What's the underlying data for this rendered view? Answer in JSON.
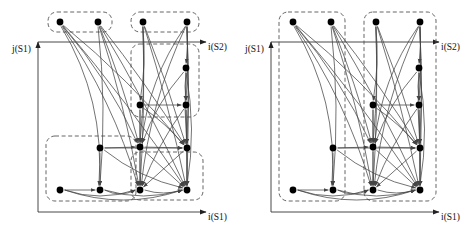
{
  "figure": {
    "title": "",
    "type": "diagram",
    "background": "#ffffff",
    "line_color": "#444444",
    "node_color": "#000000",
    "dashed_color": "#555555",
    "width": 465,
    "height": 237
  },
  "panels": [
    {
      "id": "left",
      "name": "left-diagram",
      "axes": {
        "y_label": "j(S1)",
        "x_bottom_label": "i(S1)",
        "x_top_label": "i(S2)"
      },
      "groups": [
        {
          "name": "top-left-group",
          "x": 48,
          "y": 12,
          "w": 64,
          "h": 20
        },
        {
          "name": "top-right-group",
          "x": 131,
          "y": 12,
          "w": 68,
          "h": 20
        },
        {
          "name": "mid-right-group",
          "x": 131,
          "y": 44,
          "w": 68,
          "h": 73
        },
        {
          "name": "bottom-left-group",
          "x": 46,
          "y": 136,
          "w": 90,
          "h": 65
        },
        {
          "name": "bottom-right-group",
          "x": 131,
          "y": 152,
          "w": 72,
          "h": 48
        }
      ],
      "nodes": [
        {
          "id": "n1",
          "x": 60,
          "y": 22
        },
        {
          "id": "n2",
          "x": 98,
          "y": 22
        },
        {
          "id": "n3",
          "x": 143,
          "y": 22
        },
        {
          "id": "n4",
          "x": 187,
          "y": 22
        },
        {
          "id": "n5",
          "x": 186,
          "y": 68
        },
        {
          "id": "n6",
          "x": 140,
          "y": 105
        },
        {
          "id": "n7",
          "x": 186,
          "y": 105
        },
        {
          "id": "n8",
          "x": 100,
          "y": 148
        },
        {
          "id": "n9",
          "x": 140,
          "y": 147
        },
        {
          "id": "n10",
          "x": 187,
          "y": 148
        },
        {
          "id": "n11",
          "x": 60,
          "y": 190
        },
        {
          "id": "n12",
          "x": 100,
          "y": 190
        },
        {
          "id": "n13",
          "x": 140,
          "y": 190
        },
        {
          "id": "n14",
          "x": 187,
          "y": 190
        }
      ],
      "edges": [
        {
          "from": "n1",
          "to": "n12",
          "curve": -26
        },
        {
          "from": "n1",
          "to": "n9",
          "curve": -10
        },
        {
          "from": "n1",
          "to": "n13",
          "curve": -14
        },
        {
          "from": "n1",
          "to": "n10",
          "curve": -8
        },
        {
          "from": "n1",
          "to": "n14",
          "curve": -6
        },
        {
          "from": "n2",
          "to": "n12",
          "curve": -8
        },
        {
          "from": "n2",
          "to": "n9",
          "curve": -4
        },
        {
          "from": "n2",
          "to": "n10",
          "curve": -4
        },
        {
          "from": "n2",
          "to": "n13",
          "curve": -6
        },
        {
          "from": "n2",
          "to": "n14",
          "curve": -5
        },
        {
          "from": "n3",
          "to": "n6",
          "curve": -5
        },
        {
          "from": "n3",
          "to": "n9",
          "curve": -4
        },
        {
          "from": "n3",
          "to": "n13",
          "curve": -4
        },
        {
          "from": "n3",
          "to": "n10",
          "curve": -3
        },
        {
          "from": "n3",
          "to": "n14",
          "curve": -4
        },
        {
          "from": "n4",
          "to": "n5",
          "curve": -2
        },
        {
          "from": "n4",
          "to": "n7",
          "curve": -3
        },
        {
          "from": "n4",
          "to": "n10",
          "curve": -3
        },
        {
          "from": "n4",
          "to": "n14",
          "curve": -3
        },
        {
          "from": "n4",
          "to": "n13",
          "curve": 14
        },
        {
          "from": "n5",
          "to": "n7",
          "curve": 2
        },
        {
          "from": "n5",
          "to": "n9",
          "curve": 8
        },
        {
          "from": "n5",
          "to": "n10",
          "curve": 3
        },
        {
          "from": "n6",
          "to": "n7",
          "curve": 0
        },
        {
          "from": "n6",
          "to": "n9",
          "curve": 0
        },
        {
          "from": "n6",
          "to": "n13",
          "curve": 0
        },
        {
          "from": "n7",
          "to": "n10",
          "curve": 0
        },
        {
          "from": "n7",
          "to": "n14",
          "curve": 0
        },
        {
          "from": "n7",
          "to": "n13",
          "curve": 6
        },
        {
          "from": "n8",
          "to": "n9",
          "curve": 0
        },
        {
          "from": "n8",
          "to": "n12",
          "curve": 0
        },
        {
          "from": "n8",
          "to": "n10",
          "curve": 0
        },
        {
          "from": "n9",
          "to": "n10",
          "curve": 0
        },
        {
          "from": "n9",
          "to": "n13",
          "curve": 0
        },
        {
          "from": "n9",
          "to": "n14",
          "curve": 0
        },
        {
          "from": "n10",
          "to": "n14",
          "curve": 0
        },
        {
          "from": "n10",
          "to": "n13",
          "curve": 0
        },
        {
          "from": "n11",
          "to": "n12",
          "curve": 0
        },
        {
          "from": "n11",
          "to": "n13",
          "curve": 12
        },
        {
          "from": "n11",
          "to": "n14",
          "curve": 20
        },
        {
          "from": "n12",
          "to": "n13",
          "curve": 8
        },
        {
          "from": "n12",
          "to": "n14",
          "curve": 12
        },
        {
          "from": "n13",
          "to": "n14",
          "curve": 6
        },
        {
          "from": "n6",
          "to": "n10",
          "curve": -4
        },
        {
          "from": "n8",
          "to": "n14",
          "curve": 10
        },
        {
          "from": "n5",
          "to": "n14",
          "curve": -10
        },
        {
          "from": "n4",
          "to": "n9",
          "curve": 16
        }
      ]
    },
    {
      "id": "right",
      "name": "right-diagram",
      "axes": {
        "y_label": "j(S1)",
        "x_bottom_label": "i(S1)",
        "x_top_label": "i(S2)"
      },
      "groups": [
        {
          "name": "left-column-group",
          "x": 46,
          "y": 12,
          "w": 66,
          "h": 189
        },
        {
          "name": "right-column-group",
          "x": 131,
          "y": 12,
          "w": 72,
          "h": 189
        }
      ],
      "nodes": [
        {
          "id": "n1",
          "x": 60,
          "y": 22
        },
        {
          "id": "n2",
          "x": 98,
          "y": 22
        },
        {
          "id": "n3",
          "x": 143,
          "y": 22
        },
        {
          "id": "n4",
          "x": 187,
          "y": 22
        },
        {
          "id": "n5",
          "x": 186,
          "y": 68
        },
        {
          "id": "n6",
          "x": 140,
          "y": 105
        },
        {
          "id": "n7",
          "x": 186,
          "y": 105
        },
        {
          "id": "n8",
          "x": 100,
          "y": 148
        },
        {
          "id": "n9",
          "x": 140,
          "y": 147
        },
        {
          "id": "n10",
          "x": 187,
          "y": 148
        },
        {
          "id": "n11",
          "x": 60,
          "y": 190
        },
        {
          "id": "n12",
          "x": 100,
          "y": 190
        },
        {
          "id": "n13",
          "x": 140,
          "y": 190
        },
        {
          "id": "n14",
          "x": 187,
          "y": 190
        }
      ],
      "edges": [
        {
          "from": "n1",
          "to": "n12",
          "curve": -26
        },
        {
          "from": "n1",
          "to": "n9",
          "curve": -10
        },
        {
          "from": "n1",
          "to": "n13",
          "curve": -14
        },
        {
          "from": "n1",
          "to": "n10",
          "curve": -8
        },
        {
          "from": "n1",
          "to": "n14",
          "curve": -6
        },
        {
          "from": "n2",
          "to": "n12",
          "curve": -8
        },
        {
          "from": "n2",
          "to": "n9",
          "curve": -4
        },
        {
          "from": "n2",
          "to": "n10",
          "curve": -4
        },
        {
          "from": "n2",
          "to": "n13",
          "curve": -6
        },
        {
          "from": "n2",
          "to": "n14",
          "curve": -5
        },
        {
          "from": "n3",
          "to": "n6",
          "curve": -5
        },
        {
          "from": "n3",
          "to": "n9",
          "curve": -4
        },
        {
          "from": "n3",
          "to": "n13",
          "curve": -4
        },
        {
          "from": "n3",
          "to": "n10",
          "curve": -3
        },
        {
          "from": "n3",
          "to": "n14",
          "curve": -4
        },
        {
          "from": "n4",
          "to": "n5",
          "curve": -2
        },
        {
          "from": "n4",
          "to": "n7",
          "curve": -3
        },
        {
          "from": "n4",
          "to": "n10",
          "curve": -3
        },
        {
          "from": "n4",
          "to": "n14",
          "curve": -3
        },
        {
          "from": "n4",
          "to": "n13",
          "curve": 14
        },
        {
          "from": "n5",
          "to": "n7",
          "curve": 2
        },
        {
          "from": "n5",
          "to": "n9",
          "curve": 8
        },
        {
          "from": "n5",
          "to": "n10",
          "curve": 3
        },
        {
          "from": "n6",
          "to": "n7",
          "curve": 0
        },
        {
          "from": "n6",
          "to": "n9",
          "curve": 0
        },
        {
          "from": "n6",
          "to": "n13",
          "curve": 0
        },
        {
          "from": "n7",
          "to": "n10",
          "curve": 0
        },
        {
          "from": "n7",
          "to": "n14",
          "curve": 0
        },
        {
          "from": "n7",
          "to": "n13",
          "curve": 6
        },
        {
          "from": "n8",
          "to": "n9",
          "curve": 0
        },
        {
          "from": "n8",
          "to": "n12",
          "curve": 0
        },
        {
          "from": "n8",
          "to": "n10",
          "curve": 0
        },
        {
          "from": "n9",
          "to": "n10",
          "curve": 0
        },
        {
          "from": "n9",
          "to": "n13",
          "curve": 0
        },
        {
          "from": "n9",
          "to": "n14",
          "curve": 0
        },
        {
          "from": "n10",
          "to": "n14",
          "curve": 0
        },
        {
          "from": "n10",
          "to": "n13",
          "curve": 0
        },
        {
          "from": "n11",
          "to": "n12",
          "curve": 0
        },
        {
          "from": "n11",
          "to": "n13",
          "curve": 12
        },
        {
          "from": "n11",
          "to": "n14",
          "curve": 20
        },
        {
          "from": "n12",
          "to": "n13",
          "curve": 8
        },
        {
          "from": "n12",
          "to": "n14",
          "curve": 12
        },
        {
          "from": "n13",
          "to": "n14",
          "curve": 6
        },
        {
          "from": "n6",
          "to": "n10",
          "curve": -4
        },
        {
          "from": "n8",
          "to": "n14",
          "curve": 10
        },
        {
          "from": "n5",
          "to": "n14",
          "curve": -10
        },
        {
          "from": "n4",
          "to": "n9",
          "curve": 16
        }
      ]
    }
  ],
  "geometry": {
    "y_axis_x": 38,
    "y_axis_top": 42,
    "y_axis_bottom": 212,
    "x_axis_bottom_y": 212,
    "x_axis_bottom_right": 206,
    "x_axis_top_y": 42,
    "x_axis_top_left": 38,
    "x_axis_top_right": 206,
    "node_radius": 3.4,
    "label_positions": {
      "y_label_x": 12,
      "y_label_y": 52,
      "x_top_label_x": 208,
      "x_top_label_y": 50,
      "x_bottom_label_x": 208,
      "x_bottom_label_y": 220
    }
  }
}
